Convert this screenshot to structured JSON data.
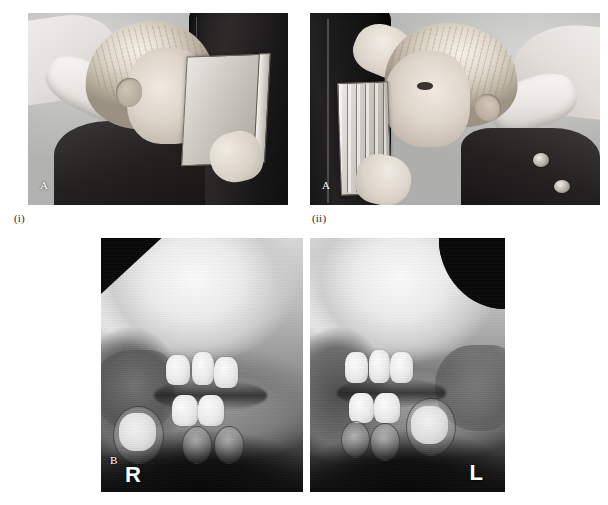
{
  "figure": {
    "kind": "dental-radiography-figure",
    "background_color": "#ffffff"
  },
  "panels": [
    {
      "id": "photo-i",
      "letter_label": "A",
      "caption": "(i)",
      "description": "Child seated with head against chair headrest; operator supports an intra-oral cassette held flat against the cheek for an oblique lateral radiograph."
    },
    {
      "id": "photo-ii",
      "letter_label": "A",
      "caption": "(ii)",
      "description": "Opposite-side positioning; operator steadies the child's forehead while the cassette is held against the other cheek."
    },
    {
      "id": "radiograph-panel",
      "letter_label": "B",
      "caption": "",
      "description": "Resulting pair of oblique lateral radiographs of the mandible showing the developing dentition on both sides."
    }
  ],
  "radiographs": [
    {
      "id": "radiograph-right",
      "side_marker": "R"
    },
    {
      "id": "radiograph-left",
      "side_marker": "L"
    }
  ],
  "colors": {
    "page_background": "#ffffff",
    "radiograph_dark": "#080808",
    "radiograph_bright": "#fbfbfb",
    "marker_text": "#ffffff",
    "caption_text": "#2a2a2a"
  }
}
